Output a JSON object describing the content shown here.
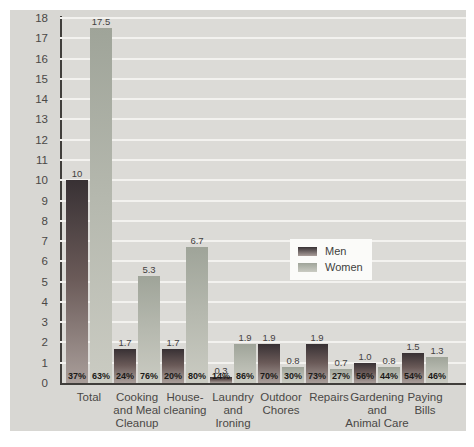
{
  "palette": {
    "card_bg": "#d8d7d3",
    "plot_bg": "#dcdbd7",
    "gridline": "#f3f2ef",
    "axis": "#403e3b",
    "text": "#4a4846",
    "value_label": "#43413f",
    "pct_label": "#1b1a18",
    "legend_bg": "#fbfbf9"
  },
  "chart_data": {
    "type": "bar",
    "title": "",
    "ylabel": "Hours per Week",
    "xlabel": "",
    "ylim": [
      0,
      18
    ],
    "ytick_step": 1,
    "grid": "horizontal white gridlines at every 1 hour on gray plot background",
    "legend_position": "center-right inside plot, white box",
    "categories": [
      "Total",
      "Cooking and Meal Cleanup",
      "House-cleaning",
      "Laundry and Ironing",
      "Outdoor Chores",
      "Repairs",
      "Gardening and Animal Care",
      "Paying Bills"
    ],
    "category_lines": [
      [
        "Total"
      ],
      [
        "Cooking",
        "and Meal",
        "Cleanup"
      ],
      [
        "House-",
        "cleaning"
      ],
      [
        "Laundry",
        "and",
        "Ironing"
      ],
      [
        "Outdoor",
        "Chores"
      ],
      [
        "Repairs"
      ],
      [
        "Gardening",
        "and",
        "Animal Care"
      ],
      [
        "Paying",
        "Bills"
      ]
    ],
    "series": [
      {
        "name": "Men",
        "values": [
          10,
          1.7,
          1.7,
          0.3,
          1.9,
          1.9,
          1.0,
          1.5
        ],
        "values_display": [
          "10",
          "1.7",
          "1.7",
          "0.3",
          "1.9",
          "1.9",
          "1.0",
          "1.5"
        ],
        "pct_labels": [
          "37%",
          "24%",
          "20%",
          "14%",
          "70%",
          "73%",
          "56%",
          "54%"
        ],
        "color_top": "#383134",
        "color_mid": "#6a5a58",
        "color_bottom": "#a99e9a"
      },
      {
        "name": "Women",
        "values": [
          17.5,
          5.3,
          6.7,
          1.9,
          0.8,
          0.7,
          0.8,
          1.3
        ],
        "values_display": [
          "17.5",
          "5.3",
          "6.7",
          "1.9",
          "0.8",
          "0.7",
          "0.8",
          "1.3"
        ],
        "pct_labels": [
          "63%",
          "76%",
          "80%",
          "86%",
          "30%",
          "27%",
          "44%",
          "46%"
        ],
        "color_top": "#9fa499",
        "color_mid": "#b5b8ae",
        "color_bottom": "#cacbc2"
      }
    ]
  }
}
